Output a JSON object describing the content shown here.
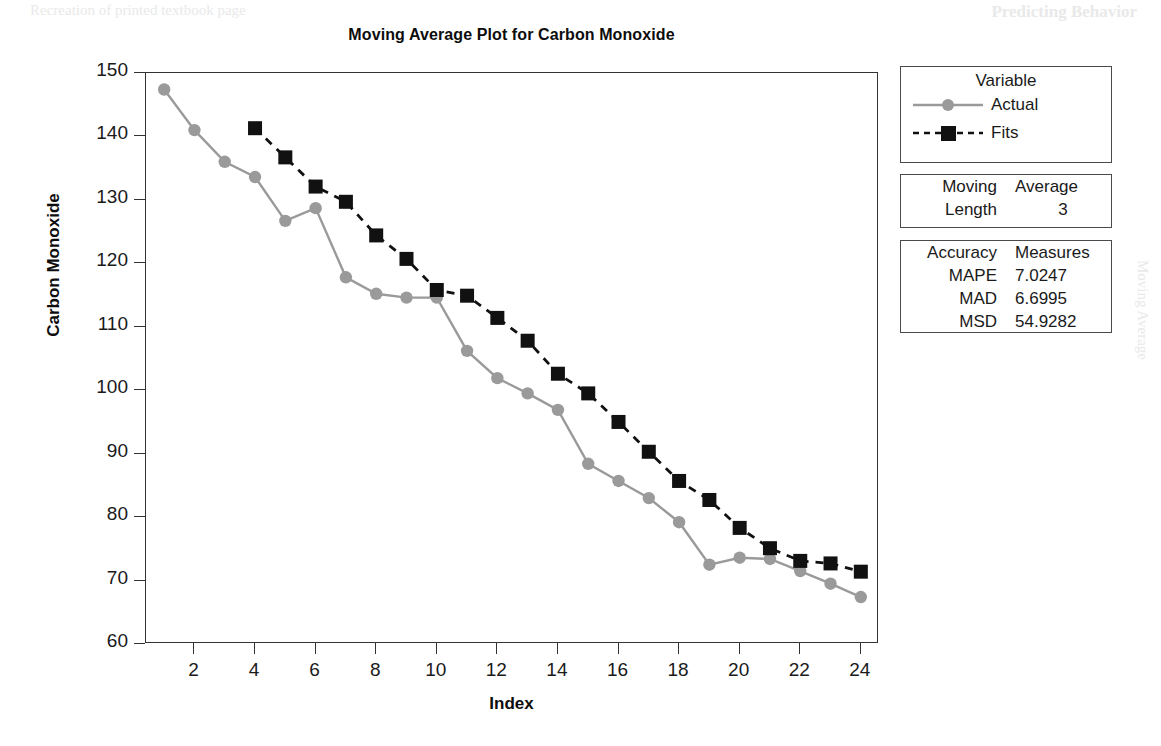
{
  "page": {
    "artifact_top_left": "Recreation of printed textbook page",
    "artifact_top_right": "Predicting Behavior",
    "artifact_mid_right": "Moving Average"
  },
  "chart_data": {
    "type": "line",
    "title": "Moving Average Plot for Carbon Monoxide",
    "xlabel": "Index",
    "ylabel": "Carbon Monoxide",
    "xlim": [
      0.4,
      24.6
    ],
    "ylim": [
      60,
      150
    ],
    "xticks": [
      2,
      4,
      6,
      8,
      10,
      12,
      14,
      16,
      18,
      20,
      22,
      24
    ],
    "yticks": [
      60,
      70,
      80,
      90,
      100,
      110,
      120,
      130,
      140,
      150
    ],
    "grid": false,
    "legend_position": "right-outside",
    "x": [
      1,
      2,
      3,
      4,
      5,
      6,
      7,
      8,
      9,
      10,
      11,
      12,
      13,
      14,
      15,
      16,
      17,
      18,
      19,
      20,
      21,
      22,
      23,
      24
    ],
    "series": [
      {
        "name": "Actual",
        "color": "#9a9a9a",
        "marker": "circle",
        "linestyle": "solid",
        "values": [
          147.4,
          141.0,
          136.0,
          133.6,
          126.7,
          128.7,
          117.8,
          115.2,
          114.6,
          114.6,
          106.2,
          101.9,
          99.5,
          96.9,
          88.4,
          85.7,
          83.0,
          79.2,
          72.5,
          73.6,
          73.4,
          71.5,
          69.5,
          67.4
        ]
      },
      {
        "name": "Fits",
        "color": "#111111",
        "marker": "square",
        "linestyle": "dashed",
        "values": [
          null,
          null,
          null,
          141.3,
          136.7,
          132.1,
          129.7,
          124.4,
          120.7,
          115.8,
          114.9,
          111.4,
          107.8,
          102.6,
          99.5,
          95.0,
          90.3,
          85.7,
          82.7,
          78.3,
          75.1,
          73.1,
          72.7,
          71.4
        ]
      }
    ]
  },
  "legend": {
    "title": "Variable",
    "entries": [
      {
        "label": "Actual"
      },
      {
        "label": "Fits"
      }
    ]
  },
  "moving_average_box": {
    "header_left": "Moving",
    "header_right": "Average",
    "row_label": "Length",
    "row_value": "3"
  },
  "accuracy_box": {
    "header_left": "Accuracy",
    "header_right": "Measures",
    "rows": [
      {
        "label": "MAPE",
        "value": "7.0247"
      },
      {
        "label": "MAD",
        "value": "6.6995"
      },
      {
        "label": "MSD",
        "value": "54.9282"
      }
    ]
  }
}
